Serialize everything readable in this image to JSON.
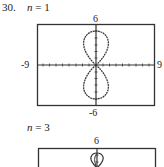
{
  "problem": {
    "number": "30.",
    "panels": [
      {
        "label": "n = 1",
        "n_var": "n",
        "n_eq": " = 1",
        "window": {
          "xmin": "-9",
          "xmax": "9",
          "ymin": "-6",
          "ymax": "6"
        }
      },
      {
        "label": "n = 3",
        "n_var": "n",
        "n_eq": " = 3",
        "window": {
          "ymax": "6"
        }
      }
    ]
  }
}
